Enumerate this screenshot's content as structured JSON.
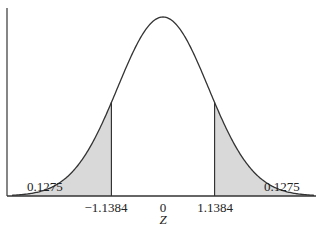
{
  "chart_data": {
    "type": "area",
    "title": "",
    "subtitle": "",
    "xlabel": "Z",
    "ylabel": "",
    "grid": false,
    "legend": null,
    "distribution": {
      "name": "standard normal",
      "mean": 0,
      "sd": 1
    },
    "x_ticks": [
      {
        "value": -1.1384,
        "label": "−1.1384"
      },
      {
        "value": 0,
        "label": "0"
      },
      {
        "value": 1.1384,
        "label": "1.1384"
      }
    ],
    "shaded_regions": [
      {
        "from": "-inf",
        "to": -1.1384,
        "area": 0.1275,
        "label": "0.1275",
        "side": "left"
      },
      {
        "from": 1.1384,
        "to": "inf",
        "area": 0.1275,
        "label": "0.1275",
        "side": "right"
      }
    ],
    "colors": {
      "curve": "#333333",
      "shade": "#d9d9d9",
      "axis": "#333333"
    }
  },
  "labels": {
    "left_area": "0.1275",
    "right_area": "0.1275",
    "tick_left": "−1.1384",
    "tick_center": "0",
    "tick_right": "1.1384",
    "axis_title": "Z"
  }
}
